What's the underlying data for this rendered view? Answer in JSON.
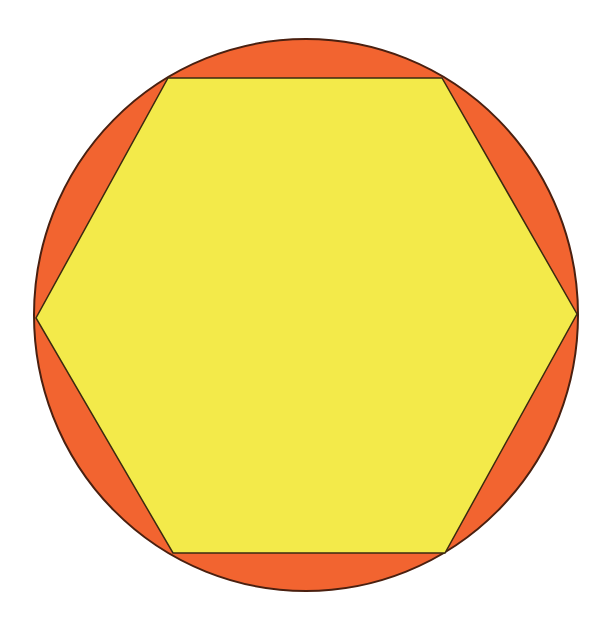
{
  "diagram": {
    "type": "hexagon-inscribed-in-circle",
    "circle": {
      "cx": 306,
      "cy": 315,
      "rx": 272,
      "ry": 276,
      "fill": "#f26430",
      "stroke": "#4a2010"
    },
    "hexagon": {
      "points": "168,78 442,78 577,314 445,553 173,553 36,318",
      "fill": "#f3ea4a",
      "stroke": "#3a2a10"
    },
    "background": "#ffffff"
  }
}
